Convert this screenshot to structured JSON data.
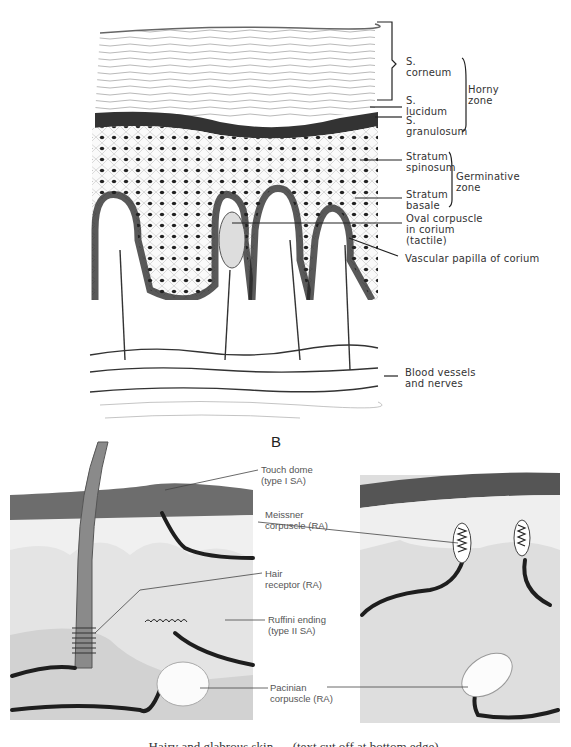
{
  "figure": {
    "panel_a": {
      "labels": {
        "s_corneum": "S.\ncorneum",
        "horny_zone": "Horny\nzone",
        "s_lucidum": "S.\nlucidum",
        "s_granulosum": "S.\ngranulosum",
        "stratum_spinosum": "Stratum\nspinosum",
        "germinative_zone": "Germinative\nzone",
        "stratum_basale": "Stratum\nbasale",
        "oval_corpuscle": "Oval corpuscle\nin corium\n(tactile)",
        "vascular_papilla": "Vascular papilla of corium",
        "blood_vessels": "Blood vessels\nand nerves"
      }
    },
    "panel_b": {
      "letter": "B",
      "labels": {
        "touch_dome": "Touch dome\n(type I SA)",
        "meissner": "Meissner\ncorpuscle (RA)",
        "hair_receptor": "Hair\nreceptor (RA)",
        "ruffini": "Ruffini ending\n(type II SA)",
        "pacinian": "Pacinian\ncorpuscle (RA)"
      }
    },
    "caption_partial": "… Hairy and glabrous skin … (text cut off at bottom edge)"
  },
  "colors": {
    "ink": "#2a2a2a",
    "epidermis_dark": "#5a5a5a",
    "dermis_gray": "#d9d9d9",
    "subcutis_gray": "#c8c8c8",
    "nerve": "#1e1e1e"
  }
}
